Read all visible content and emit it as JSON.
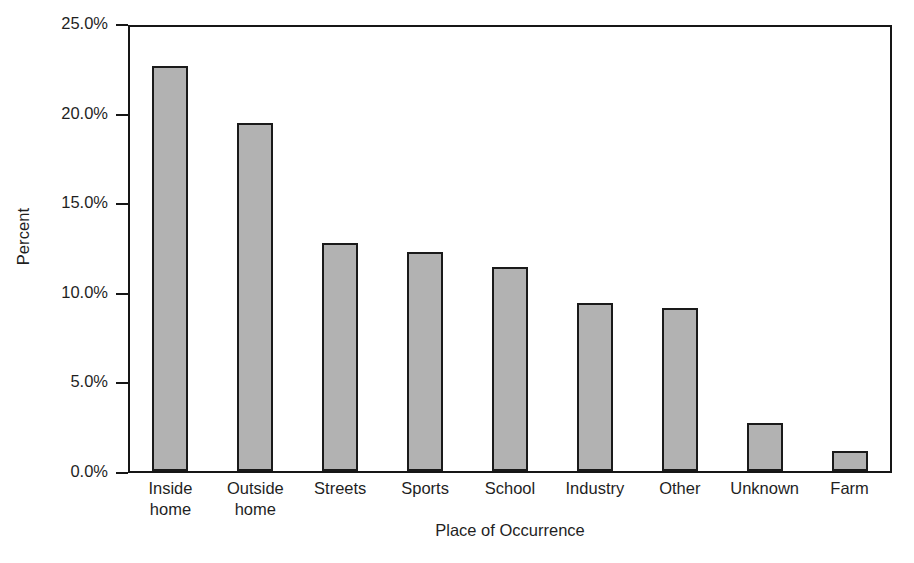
{
  "chart_data": {
    "type": "bar",
    "title": "",
    "xlabel": "Place of Occurrence",
    "ylabel": "Percent",
    "categories": [
      "Inside home",
      "Outside home",
      "Streets",
      "Sports",
      "School",
      "Industry",
      "Other",
      "Unknown",
      "Farm"
    ],
    "category_lines": [
      [
        "Inside",
        "home"
      ],
      [
        "Outside",
        "home"
      ],
      [
        "Streets",
        ""
      ],
      [
        "Sports",
        ""
      ],
      [
        "School",
        ""
      ],
      [
        "Industry",
        ""
      ],
      [
        "Other",
        ""
      ],
      [
        "Unknown",
        ""
      ],
      [
        "Farm",
        ""
      ]
    ],
    "values": [
      22.6,
      19.4,
      12.7,
      12.2,
      11.4,
      9.4,
      9.1,
      2.7,
      1.1
    ],
    "ylim": [
      0,
      25
    ],
    "ytick_values": [
      0,
      5,
      10,
      15,
      20,
      25
    ],
    "ytick_labels": [
      "0.0%",
      "5.0%",
      "10.0%",
      "15.0%",
      "20.0%",
      "25.0%"
    ],
    "grid": false,
    "legend": "none",
    "bar_color": "#b2b2b2",
    "bar_edge_color": "#1a1a1a",
    "axis_color": "#161616"
  }
}
